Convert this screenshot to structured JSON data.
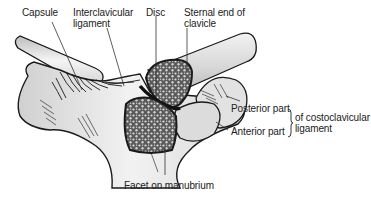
{
  "labels": {
    "capsule": "Capsule",
    "interclavicular_line1": "Interclavicular",
    "interclavicular_line2": "ligament",
    "disc": "Disc",
    "sternal_end_line1": "Sternal end of",
    "sternal_end_line2": "clavicle",
    "posterior_part": "Posterior part",
    "anterior_part": "Anterior part",
    "costoclavicular_line1": "of costoclavicular",
    "costoclavicular_line2": "ligament",
    "facet": "Facet on manubrium"
  },
  "colors": {
    "outline": "#1a1a1a",
    "bone_light": "#e8e8e8",
    "bone_shade": "#c8c8c8",
    "cancellous": "#6a6a6a",
    "leader": "#333333"
  }
}
